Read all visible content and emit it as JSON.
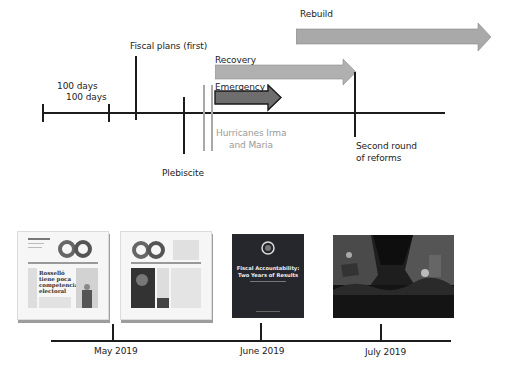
{
  "diagram": {
    "top_timeline": {
      "phases": [
        {
          "label": "Rebuild",
          "color": "#a9a9a9"
        },
        {
          "label": "Recovery",
          "color": "#b0b0b0"
        },
        {
          "label": "Emergency",
          "color": "#6e6e6e",
          "border": "#1a1a1a"
        }
      ],
      "events": [
        {
          "label": "100 days"
        },
        {
          "label": "100 days"
        },
        {
          "label": "Fiscal plans (first)"
        },
        {
          "label": "Plebiscite"
        },
        {
          "label_line1": "Hurricanes Irma",
          "label_line2": "and Maria",
          "color": "#9a9a9a"
        },
        {
          "label_line1": "Second round",
          "label_line2": "of reforms"
        }
      ]
    },
    "bottom_timeline": {
      "months": [
        {
          "label": "May 2019"
        },
        {
          "label": "June 2019"
        },
        {
          "label": "July 2019"
        }
      ],
      "thumbnails": [
        {
          "type": "newspaper",
          "headline_lines": [
            "Rosselló",
            "tiene poca",
            "competencia",
            "electoral"
          ]
        },
        {
          "type": "newspaper"
        },
        {
          "type": "report-cover",
          "title_line1": "Fiscal Accountability:",
          "title_line2": "Two Years of Results"
        },
        {
          "type": "photo",
          "subject": "protest-crowd"
        }
      ]
    }
  }
}
